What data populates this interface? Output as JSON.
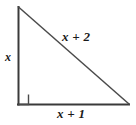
{
  "figure": {
    "kind": "right-triangle-diagram",
    "background_color": "#ffffff",
    "stroke_color": "#3a3a3a",
    "label_color": "#1a1a1a"
  },
  "labels": {
    "vertical_leg": "x",
    "hypotenuse": "x + 2",
    "horizontal_leg": "x + 1"
  },
  "geometry": {
    "vertices": {
      "top": [
        18,
        7
      ],
      "bottom_left": [
        18,
        104
      ],
      "bottom_right": [
        129,
        104
      ]
    },
    "right_angle_marker": {
      "at": "bottom_left",
      "size": 10
    }
  }
}
